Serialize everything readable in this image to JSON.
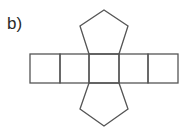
{
  "figure": {
    "label": "b)",
    "stroke_color": "#555555",
    "rectangles": [
      {
        "x": 30,
        "y": 54,
        "w": 30,
        "h": 29
      },
      {
        "x": 60,
        "y": 54,
        "w": 29,
        "h": 29
      },
      {
        "x": 89,
        "y": 54,
        "w": 30,
        "h": 29
      },
      {
        "x": 119,
        "y": 54,
        "w": 29,
        "h": 29
      },
      {
        "x": 148,
        "y": 54,
        "w": 30,
        "h": 29
      }
    ],
    "top_pentagon_points": "89,54 80,26 104,10 128,26 119,54",
    "bottom_pentagon_points": "89,83 80,109 104,126 128,109 119,83"
  }
}
